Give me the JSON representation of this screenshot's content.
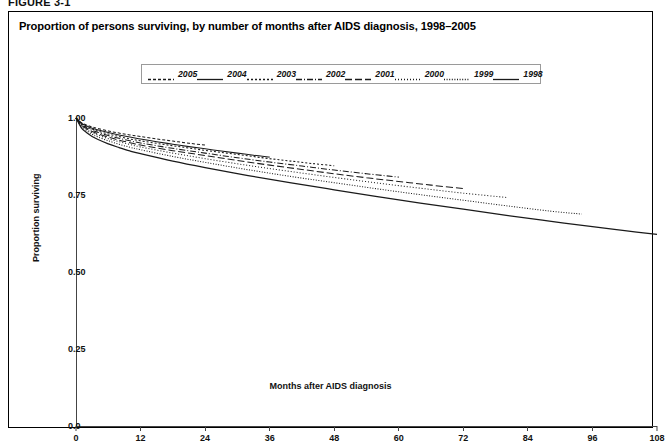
{
  "figure_label": "FIGURE 3-1",
  "panel": {
    "title": "Proportion of persons surviving, by number of months after AIDS diagnosis, 1998–2005"
  },
  "chart_data": {
    "type": "line",
    "title": "Proportion of persons surviving, by number of months after AIDS diagnosis, 1998–2005",
    "xlabel": "Months after AIDS diagnosis",
    "ylabel": "Proportion surviving",
    "xlim": [
      0,
      108
    ],
    "ylim": [
      0,
      1.0
    ],
    "xticks": [
      "0",
      "12",
      "24",
      "36",
      "48",
      "60",
      "72",
      "84",
      "96",
      "108"
    ],
    "yticks": [
      "0.0",
      "0.25",
      "0.50",
      "0.75",
      "1.00"
    ],
    "grid": false,
    "legend_position": "top-center",
    "legend_entries": [
      {
        "label": "2005",
        "dash": "3,2"
      },
      {
        "label": "2004",
        "dash": "none"
      },
      {
        "label": "2003",
        "dash": "2,2"
      },
      {
        "label": "2002",
        "dash": "6,2,1,2"
      },
      {
        "label": "2001",
        "dash": "7,3"
      },
      {
        "label": "2000",
        "dash": "1,2"
      },
      {
        "label": "1999",
        "dash": "1,1.6"
      },
      {
        "label": "1998",
        "dash": "none"
      }
    ],
    "series": [
      {
        "name": "2005",
        "dash": "3,2",
        "x": [
          0,
          1,
          2,
          3,
          4,
          6,
          8,
          10,
          12,
          15,
          18,
          21,
          24
        ],
        "y": [
          1.0,
          0.985,
          0.977,
          0.971,
          0.966,
          0.958,
          0.951,
          0.945,
          0.94,
          0.932,
          0.925,
          0.918,
          0.912
        ]
      },
      {
        "name": "2004",
        "dash": "none",
        "x": [
          0,
          1,
          2,
          3,
          4,
          6,
          8,
          10,
          12,
          15,
          18,
          21,
          24,
          27,
          30,
          33,
          36
        ],
        "y": [
          1.0,
          0.983,
          0.974,
          0.967,
          0.962,
          0.953,
          0.945,
          0.938,
          0.932,
          0.923,
          0.915,
          0.907,
          0.9,
          0.893,
          0.886,
          0.879,
          0.873
        ]
      },
      {
        "name": "2003",
        "dash": "2,2",
        "x": [
          0,
          1,
          2,
          3,
          4,
          6,
          8,
          10,
          12,
          16,
          20,
          24,
          28,
          32,
          36,
          40,
          44,
          48
        ],
        "y": [
          1.0,
          0.981,
          0.971,
          0.964,
          0.958,
          0.948,
          0.94,
          0.932,
          0.926,
          0.915,
          0.905,
          0.895,
          0.886,
          0.877,
          0.868,
          0.86,
          0.852,
          0.845
        ]
      },
      {
        "name": "2002",
        "dash": "6,2,1,2",
        "x": [
          0,
          1,
          2,
          3,
          4,
          6,
          8,
          10,
          12,
          16,
          20,
          24,
          30,
          36,
          42,
          48,
          54,
          60
        ],
        "y": [
          1.0,
          0.979,
          0.968,
          0.96,
          0.954,
          0.943,
          0.934,
          0.926,
          0.919,
          0.907,
          0.896,
          0.886,
          0.871,
          0.857,
          0.844,
          0.831,
          0.819,
          0.808
        ]
      },
      {
        "name": "2001",
        "dash": "7,3",
        "x": [
          0,
          1,
          2,
          3,
          4,
          6,
          8,
          10,
          12,
          18,
          24,
          30,
          36,
          42,
          48,
          54,
          60,
          66,
          72
        ],
        "y": [
          1.0,
          0.977,
          0.965,
          0.956,
          0.949,
          0.938,
          0.928,
          0.92,
          0.912,
          0.894,
          0.878,
          0.862,
          0.847,
          0.833,
          0.819,
          0.806,
          0.794,
          0.782,
          0.771
        ]
      },
      {
        "name": "2000",
        "dash": "1,2",
        "x": [
          0,
          1,
          2,
          3,
          4,
          6,
          8,
          10,
          12,
          18,
          24,
          32,
          40,
          48,
          56,
          64,
          72,
          80
        ],
        "y": [
          1.0,
          0.975,
          0.962,
          0.952,
          0.945,
          0.933,
          0.923,
          0.914,
          0.906,
          0.886,
          0.868,
          0.846,
          0.826,
          0.807,
          0.789,
          0.772,
          0.756,
          0.742
        ]
      },
      {
        "name": "1999",
        "dash": "1,1.6",
        "x": [
          0,
          1,
          2,
          3,
          4,
          6,
          8,
          10,
          12,
          18,
          24,
          32,
          40,
          48,
          56,
          64,
          72,
          80,
          88,
          94
        ],
        "y": [
          1.0,
          0.972,
          0.958,
          0.947,
          0.939,
          0.926,
          0.915,
          0.905,
          0.897,
          0.875,
          0.856,
          0.832,
          0.81,
          0.79,
          0.77,
          0.751,
          0.733,
          0.715,
          0.698,
          0.688
        ]
      },
      {
        "name": "1998",
        "dash": "none",
        "x": [
          0,
          1,
          2,
          3,
          4,
          6,
          8,
          10,
          12,
          18,
          24,
          32,
          40,
          48,
          56,
          64,
          72,
          80,
          88,
          96,
          102,
          108
        ],
        "y": [
          1.0,
          0.968,
          0.952,
          0.94,
          0.931,
          0.916,
          0.904,
          0.893,
          0.884,
          0.86,
          0.839,
          0.813,
          0.789,
          0.767,
          0.745,
          0.724,
          0.704,
          0.684,
          0.665,
          0.647,
          0.634,
          0.622
        ]
      }
    ]
  }
}
